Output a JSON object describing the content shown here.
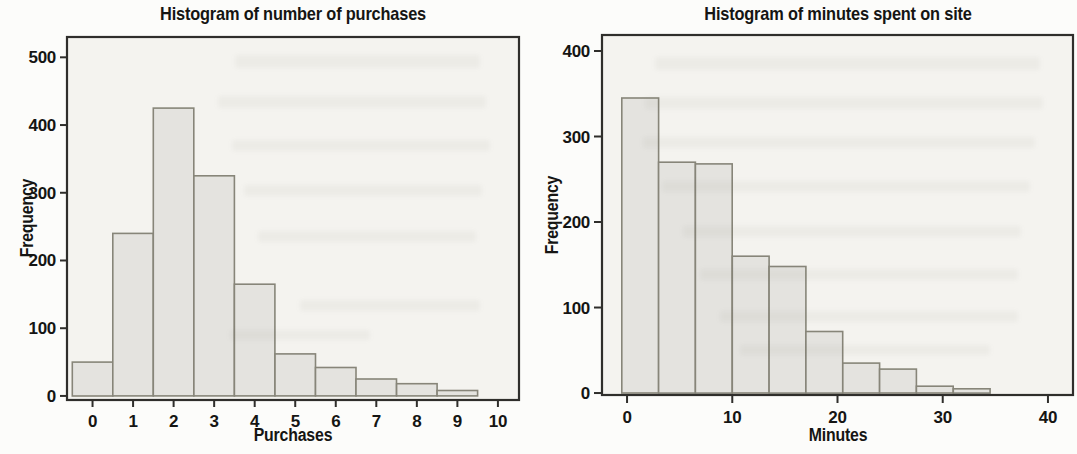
{
  "style": {
    "page_bg": "#fcfcfa",
    "plot_bg": "#f4f3ef",
    "bar_fill": "#e4e3df",
    "bar_stroke": "#878579",
    "axis_color": "#2f2e2b",
    "text_color": "#151513"
  },
  "chart_data": [
    {
      "type": "bar",
      "subtype": "histogram",
      "title": "Histogram of number of purchases",
      "xlabel": "Purchases",
      "ylabel": "Frequency",
      "bin_start": -0.5,
      "bin_width": 1,
      "bin_centers": [
        0,
        1,
        2,
        3,
        4,
        5,
        6,
        7,
        8,
        9
      ],
      "values": [
        50,
        240,
        425,
        325,
        165,
        62,
        42,
        25,
        18,
        8
      ],
      "x_ticks": [
        0,
        1,
        2,
        3,
        4,
        5,
        6,
        7,
        8,
        9,
        10
      ],
      "y_ticks": [
        0,
        100,
        200,
        300,
        400,
        500
      ],
      "xlim": [
        -0.63,
        10.52
      ],
      "ylim": [
        -6,
        530
      ],
      "grid": false,
      "legend": null
    },
    {
      "type": "bar",
      "subtype": "histogram",
      "title": "Histogram of minutes spent on site",
      "xlabel": "Minutes",
      "ylabel": "Frequency",
      "bin_start": -0.5,
      "bin_width": 3.5,
      "bin_centers": [
        1.25,
        4.75,
        8.25,
        11.75,
        15.25,
        18.75,
        22.25,
        25.75,
        29.25,
        32.75
      ],
      "values": [
        345,
        270,
        268,
        160,
        148,
        72,
        35,
        28,
        8,
        5
      ],
      "x_ticks": [
        0,
        10,
        20,
        30,
        40
      ],
      "y_ticks": [
        0,
        100,
        200,
        300,
        400
      ],
      "xlim": [
        -2.38,
        42.38
      ],
      "ylim": [
        -2.3,
        418.7
      ],
      "grid": false,
      "legend": null
    }
  ]
}
